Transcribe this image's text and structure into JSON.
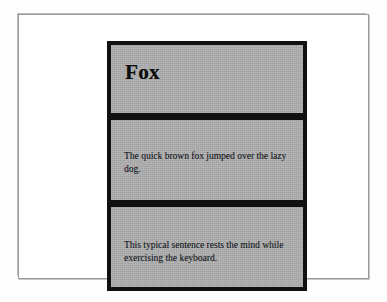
{
  "document": {
    "page_background_color": "#ffffff",
    "frame_border_color": "#9a9a9a",
    "panel_fill_color": "#aeaeae",
    "panel_border_color": "#111111",
    "text_color": "#14191f",
    "panels": [
      {
        "kind": "title",
        "name": "title-panel",
        "title": "Fox"
      },
      {
        "kind": "text",
        "name": "body-panel-1",
        "text": "The quick brown fox jumped over the lazy dog."
      },
      {
        "kind": "text",
        "name": "body-panel-2",
        "text": "This typical sentence rests the mind while exercising the keyboard."
      }
    ]
  }
}
